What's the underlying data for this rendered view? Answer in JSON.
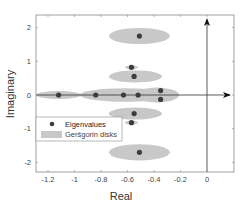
{
  "chart_data": {
    "type": "scatter",
    "title": "",
    "xlabel": "Real",
    "ylabel": "Imaginary",
    "xlim": [
      -1.3,
      0.2
    ],
    "ylim": [
      -2.3,
      2.3
    ],
    "xticks": [
      "-1.2",
      "-1",
      "-0.8",
      "-0.6",
      "-0.4",
      "-0.2",
      "0"
    ],
    "yticks": [
      "2",
      "1",
      "0",
      "-1",
      "-2"
    ],
    "grid": false,
    "legend_position": "lower left",
    "legend": [
      "Eigenvalues",
      "Geršgorin disks"
    ],
    "series": [
      {
        "name": "Eigenvalues",
        "points": [
          {
            "x": -1.12,
            "y": 0.0
          },
          {
            "x": -0.84,
            "y": 0.0
          },
          {
            "x": -0.63,
            "y": 0.0
          },
          {
            "x": -0.52,
            "y": 0.0
          },
          {
            "x": -0.35,
            "y": 0.13
          },
          {
            "x": -0.35,
            "y": -0.13
          },
          {
            "x": -0.51,
            "y": 1.75
          },
          {
            "x": -0.57,
            "y": 0.82
          },
          {
            "x": -0.55,
            "y": 0.55
          },
          {
            "x": -0.55,
            "y": -0.55
          },
          {
            "x": -0.57,
            "y": -0.82
          },
          {
            "x": -0.51,
            "y": -1.7
          }
        ]
      },
      {
        "name": "Geršgorin disks",
        "disks": [
          {
            "cx": -1.12,
            "cy": 0.0,
            "rx": 0.17,
            "ry": 0.12
          },
          {
            "cx": -0.62,
            "cy": 0.0,
            "rx": 0.34,
            "ry": 0.2
          },
          {
            "cx": -0.38,
            "cy": 0.0,
            "rx": 0.17,
            "ry": 0.22
          },
          {
            "cx": -0.51,
            "cy": 1.75,
            "rx": 0.23,
            "ry": 0.24
          },
          {
            "cx": -0.57,
            "cy": 0.82,
            "rx": 0.05,
            "ry": 0.06
          },
          {
            "cx": -0.54,
            "cy": 0.55,
            "rx": 0.2,
            "ry": 0.18
          },
          {
            "cx": -0.54,
            "cy": -0.55,
            "rx": 0.2,
            "ry": 0.18
          },
          {
            "cx": -0.57,
            "cy": -0.82,
            "rx": 0.05,
            "ry": 0.06
          },
          {
            "cx": -0.51,
            "cy": -1.7,
            "rx": 0.23,
            "ry": 0.24
          }
        ]
      }
    ],
    "annotations": [
      "x-axis arrow at y=0",
      "y-axis arrow at x=0"
    ],
    "colors": {
      "disk": "#c8c8c8",
      "point": "#3d3d3d",
      "axis": "#333333"
    }
  }
}
